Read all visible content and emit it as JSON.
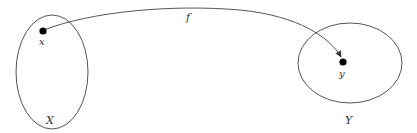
{
  "diagram": {
    "domain_set": {
      "label": "X"
    },
    "codomain_set": {
      "label": "Y"
    },
    "source_point": {
      "label": "x"
    },
    "target_point": {
      "label": "y"
    },
    "mapping": {
      "label": "f"
    },
    "colors": {
      "stroke": "#555555",
      "point": "#000000",
      "text": "#333333"
    }
  }
}
